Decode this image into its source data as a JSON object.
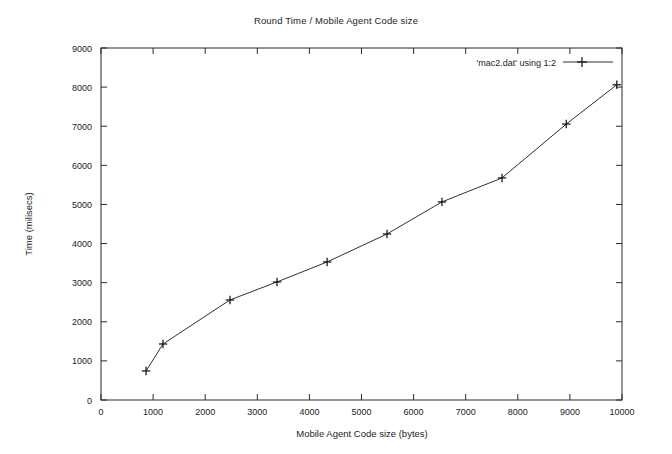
{
  "chart_data": {
    "type": "line",
    "title": "Round Time / Mobile Agent Code size",
    "xlabel": "Mobile Agent Code size (bytes)",
    "ylabel": "Time (milisecs)",
    "xlim": [
      0,
      10000
    ],
    "ylim": [
      0,
      9000
    ],
    "xticks": [
      0,
      1000,
      2000,
      3000,
      4000,
      5000,
      6000,
      7000,
      8000,
      9000,
      10000
    ],
    "yticks": [
      0,
      1000,
      2000,
      3000,
      4000,
      5000,
      6000,
      7000,
      8000,
      9000
    ],
    "xtick_labels": [
      "0",
      "1000",
      "2000",
      "3000",
      "4000",
      "5000",
      "6000",
      "7000",
      "8000",
      "9000",
      "10000"
    ],
    "ytick_labels": [
      "0",
      "1000",
      "2000",
      "3000",
      "4000",
      "5000",
      "6000",
      "7000",
      "8000",
      "9000"
    ],
    "grid": false,
    "legend_position": "top-right",
    "marker": "plus-cross",
    "line_color": "#303030",
    "series": [
      {
        "name": "'mac2.dat' using 1:2",
        "x": [
          864,
          1190,
          2476,
          3378,
          4340,
          5490,
          6545,
          7697,
          8930,
          9900
        ],
        "y": [
          742,
          1432,
          2558,
          3018,
          3530,
          4245,
          5065,
          5678,
          7055,
          8060
        ]
      }
    ]
  },
  "legend": {
    "entry_label": "'mac2.dat' using 1:2"
  },
  "axes": {
    "x_title": "Mobile Agent Code size (bytes)",
    "y_title": "Time (milisecs)"
  },
  "header": {
    "title": "Round Time / Mobile Agent Code size"
  }
}
